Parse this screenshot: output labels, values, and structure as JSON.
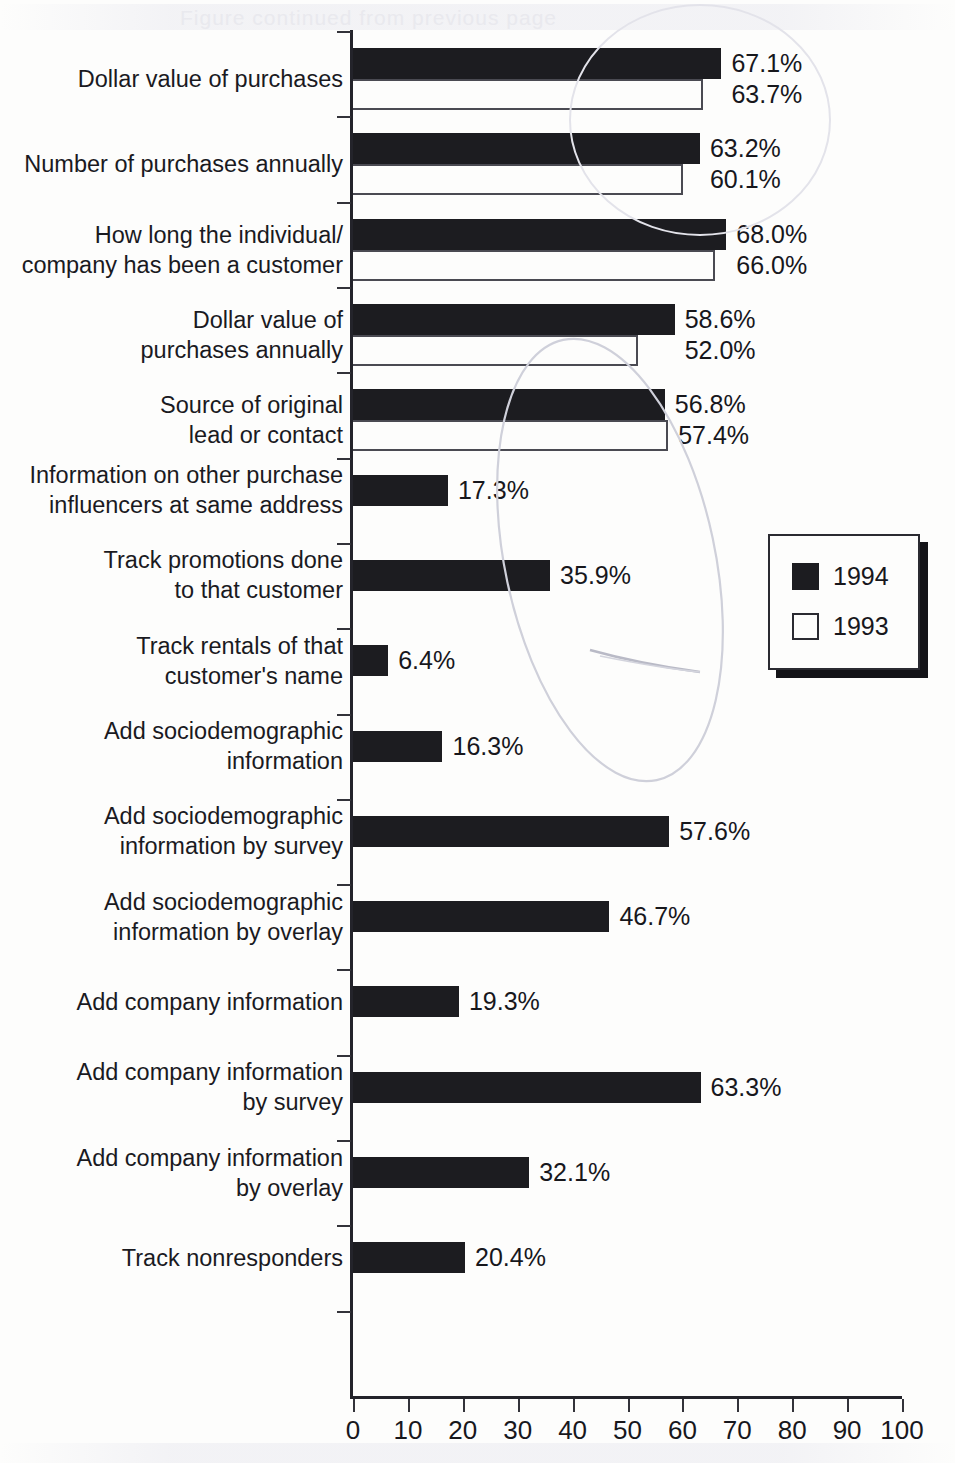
{
  "chart_data": {
    "type": "bar",
    "orientation": "horizontal",
    "title": "",
    "xlabel": "",
    "ylabel": "",
    "xlim": [
      0,
      100
    ],
    "xticks": [
      0,
      10,
      20,
      30,
      40,
      50,
      60,
      70,
      80,
      90,
      100
    ],
    "xtick_labels": [
      "0",
      "10",
      "20",
      "30",
      "40",
      "50",
      "60",
      "70",
      "80",
      "90",
      "100"
    ],
    "grid": false,
    "legend_position": "center-right",
    "value_label_suffix": "%",
    "categories": [
      "Dollar value of purchases",
      "Number of purchases annually",
      "How long the individual/\ncompany has been a customer",
      "Dollar value of\npurchases annually",
      "Source of original\nlead or contact",
      "Information on other purchase\ninfluencers at same address",
      "Track promotions done\nto that customer",
      "Track rentals of that\ncustomer's name",
      "Add sociodemographic\ninformation",
      "Add sociodemographic\ninformation by survey",
      "Add sociodemographic\ninformation by overlay",
      "Add company information",
      "Add company information\nby survey",
      "Add company information\nby overlay",
      "Track nonresponders"
    ],
    "series": [
      {
        "name": "1994",
        "color": "#1c1c20",
        "style": "filled",
        "values": [
          67.1,
          63.2,
          68.0,
          58.6,
          56.8,
          17.3,
          35.9,
          6.4,
          16.3,
          57.6,
          46.7,
          19.3,
          63.3,
          32.1,
          20.4
        ],
        "labels": [
          "67.1%",
          "63.2%",
          "68.0%",
          "58.6%",
          "56.8%",
          "17.3%",
          "35.9%",
          "6.4%",
          "16.3%",
          "57.6%",
          "46.7%",
          "19.3%",
          "63.3%",
          "32.1%",
          "20.4%"
        ]
      },
      {
        "name": "1993",
        "color": "#ffffff",
        "style": "open",
        "values": [
          63.7,
          60.1,
          66.0,
          52.0,
          57.4,
          null,
          null,
          null,
          null,
          null,
          null,
          null,
          null,
          null,
          null
        ],
        "labels": [
          "63.7%",
          "60.1%",
          "66.0%",
          "52.0%",
          "57.4%",
          null,
          null,
          null,
          null,
          null,
          null,
          null,
          null,
          null,
          null
        ]
      }
    ]
  },
  "legend": {
    "entries": [
      {
        "label": "1994",
        "swatch": "filled"
      },
      {
        "label": "1993",
        "swatch": "open"
      }
    ]
  },
  "artifacts": {
    "ghost_text_top": "Figure continued from previous page"
  }
}
